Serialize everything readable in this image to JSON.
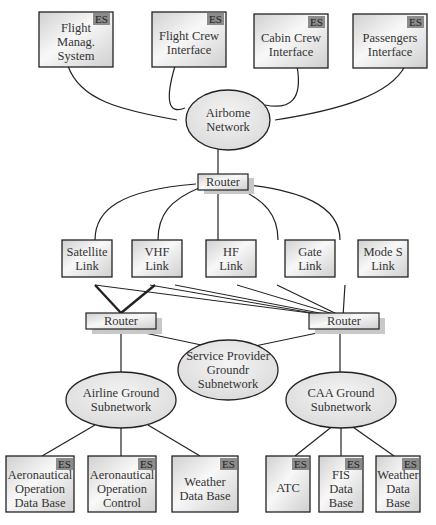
{
  "es_badge": "ES",
  "airborne": {
    "end_systems": [
      {
        "id": "fms",
        "label": "Flight\nManag.\nSystem",
        "es": true
      },
      {
        "id": "fci",
        "label": "Flight Crew\nInterface",
        "es": true
      },
      {
        "id": "cci",
        "label": "Cabin Crew\nInterface",
        "es": true
      },
      {
        "id": "pi",
        "label": "Passengers\nInterface",
        "es": true
      }
    ],
    "network": {
      "label": "Airbome\nNetwork"
    },
    "router": {
      "label": "Router"
    }
  },
  "links": [
    {
      "id": "sat",
      "label": "Satellite\nLink"
    },
    {
      "id": "vhf",
      "label": "VHF\nLink"
    },
    {
      "id": "hf",
      "label": "HF\nLink"
    },
    {
      "id": "gate",
      "label": "Gate\nLink"
    },
    {
      "id": "modes",
      "label": "Mode S\nLink"
    }
  ],
  "ground": {
    "router_left": {
      "label": "Router"
    },
    "router_right": {
      "label": "Router"
    },
    "service_provider": {
      "label": "Service Provider\nGroundr\nSubnetwork"
    },
    "airline": {
      "label": "Airline Ground\nSubnetwork"
    },
    "caa": {
      "label": "CAA Ground\nSubnetwork"
    },
    "airline_systems": [
      {
        "id": "aodb",
        "label": "Aeronautical\nOperation\nData Base",
        "es": true
      },
      {
        "id": "aoc",
        "label": "Aeronautical\nOperation\nControl",
        "es": true
      },
      {
        "id": "wdb1",
        "label": "Weather\nData Base",
        "es": true
      }
    ],
    "caa_systems": [
      {
        "id": "atc",
        "label": "ATC",
        "es": true
      },
      {
        "id": "fis",
        "label": "FIS\nData\nBase",
        "es": true
      },
      {
        "id": "wdb2",
        "label": "Weather\nData\nBase",
        "es": true
      }
    ]
  },
  "colors": {
    "box_fill_light": "#f4f4f4",
    "box_fill_dark": "#d4d4d4",
    "ellipse_fill": "#e6e6e6",
    "stroke": "#222222",
    "es_badge": "#8c8c8c",
    "shadow": "#c8c8c8"
  }
}
